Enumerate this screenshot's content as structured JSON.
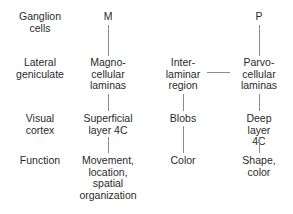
{
  "diagram": {
    "row_labels": [
      {
        "id": "ganglion",
        "text": "Ganglion\ncells"
      },
      {
        "id": "lgn",
        "text": "Lateral\ngeniculate"
      },
      {
        "id": "cortex",
        "text": "Visual\ncortex"
      },
      {
        "id": "function",
        "text": "Function"
      }
    ],
    "m_pathway": {
      "ganglion": "M",
      "lgn": "Magno-\ncellular\nlaminas",
      "cortex": "Superficial\nlayer 4C",
      "function": "Movement,\nlocation,\nspatial\norganization"
    },
    "interlaminar_pathway": {
      "lgn": "Inter-\nlaminar\nregion",
      "cortex": "Blobs",
      "function": "Color"
    },
    "p_pathway": {
      "ganglion": "P",
      "lgn": "Parvo-\ncellular\nlaminas",
      "cortex": "Deep\nlayer 4C",
      "function": "Shape,\ncolor"
    },
    "line_color": "#8a8a8a",
    "text_color": "#2a2a2a"
  }
}
